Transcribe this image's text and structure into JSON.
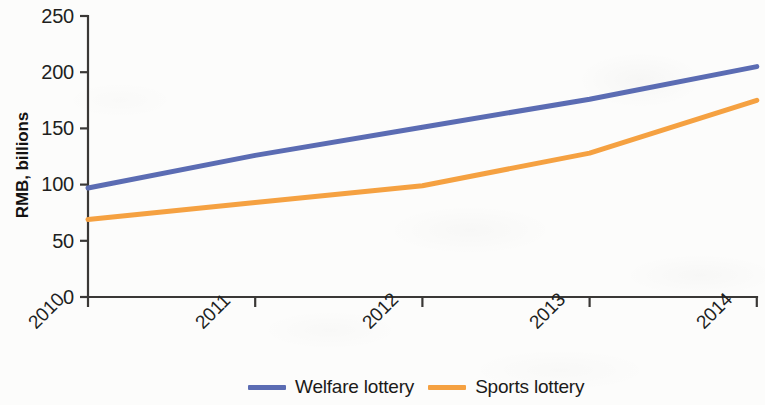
{
  "chart_data": {
    "type": "line",
    "title": "",
    "subtitle": "",
    "xlabel": "",
    "ylabel": "RMB, billions",
    "categories": [
      "2010",
      "2011",
      "2012",
      "2013",
      "2014"
    ],
    "x": [
      2010,
      2011,
      2012,
      2013,
      2014
    ],
    "series": [
      {
        "name": "Welfare lottery",
        "color": "#5b6cb3",
        "values": [
          97,
          126,
          151,
          176,
          205
        ]
      },
      {
        "name": "Sports lottery",
        "color": "#f5a141",
        "values": [
          69,
          84,
          99,
          128,
          175
        ]
      }
    ],
    "ylim": [
      0,
      250
    ],
    "yticks": [
      0,
      50,
      100,
      150,
      200,
      250
    ],
    "ytick_labels": [
      "0",
      "50",
      "100",
      "150",
      "200",
      "250"
    ],
    "xtick_labels": [
      "2010",
      "2011",
      "2012",
      "2013",
      "2014"
    ],
    "grid": false,
    "legend_position": "bottom-center",
    "xtick_label_rotation": -45
  },
  "axes": {
    "y_title": "RMB, billions",
    "y_ticks": [
      {
        "label": "250",
        "value": 250
      },
      {
        "label": "200",
        "value": 200
      },
      {
        "label": "150",
        "value": 150
      },
      {
        "label": "100",
        "value": 100
      },
      {
        "label": "50",
        "value": 50
      },
      {
        "label": "0",
        "value": 0
      }
    ],
    "x_ticks": [
      {
        "label": "2010",
        "value": 2010
      },
      {
        "label": "2011",
        "value": 2011
      },
      {
        "label": "2012",
        "value": 2012
      },
      {
        "label": "2013",
        "value": 2013
      },
      {
        "label": "2014",
        "value": 2014
      }
    ]
  },
  "legend": {
    "items": [
      {
        "label": "Welfare lottery",
        "color": "#5b6cb3"
      },
      {
        "label": "Sports lottery",
        "color": "#f5a141"
      }
    ]
  },
  "colors": {
    "welfare_lottery": "#5b6cb3",
    "sports_lottery": "#f5a141",
    "axis": "#3a3836",
    "text": "#211f1e",
    "background": "#fcfcfb"
  }
}
